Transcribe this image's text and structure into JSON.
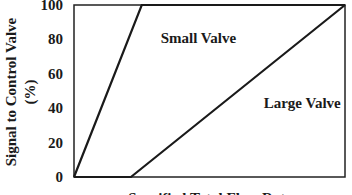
{
  "chart_data": {
    "type": "line",
    "title": "",
    "xlabel": "Specified Total Flow Rate",
    "ylabel_line1": "Signal to Control Valve",
    "ylabel_line2": "(%)",
    "ylim": [
      0,
      100
    ],
    "xlim": [
      0,
      100
    ],
    "yticks": [
      "0",
      "20",
      "40",
      "60",
      "80",
      "100"
    ],
    "ytick_values": [
      0,
      20,
      40,
      60,
      80,
      100
    ],
    "grid": false,
    "series": [
      {
        "name": "Small Valve",
        "x": [
          0,
          25,
          100
        ],
        "y": [
          0,
          100,
          100
        ]
      },
      {
        "name": "Large Valve",
        "x": [
          0,
          21,
          100
        ],
        "y": [
          0,
          0,
          100
        ]
      }
    ],
    "annotations": [
      {
        "text": "Small Valve",
        "x": 32,
        "y": 78
      },
      {
        "text": "Large Valve",
        "x": 70,
        "y": 40
      }
    ]
  }
}
